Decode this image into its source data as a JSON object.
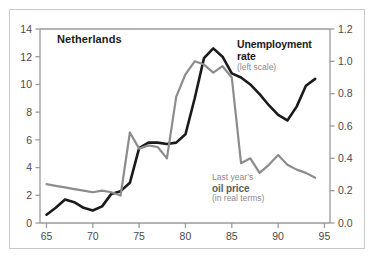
{
  "labels": {
    "country": "Netherlands",
    "unemployment_title": "Unemployment",
    "unemployment_title_line2": "rate",
    "unemployment_sub": "(left scale)",
    "oil_line1": "Last year’s",
    "oil_line2": "oil price",
    "oil_sub": "(in real terms)"
  },
  "colors": {
    "unemployment_line": "#1a1a1a",
    "oil_line": "#8c8c8c",
    "axis": "#9a9a9a",
    "tick_label": "#4a4a4a",
    "frame_border": "#c9c9c9",
    "background": "#ffffff",
    "annotation_gray": "#8a8a8a"
  },
  "axes": {
    "x_ticks": [
      "65",
      "70",
      "75",
      "80",
      "85",
      "90",
      "95"
    ],
    "x_tick_values": [
      65,
      70,
      75,
      80,
      85,
      90,
      95
    ],
    "y_left_ticks": [
      "0",
      "2",
      "4",
      "6",
      "8",
      "10",
      "12",
      "14"
    ],
    "y_left_values": [
      0,
      2,
      4,
      6,
      8,
      10,
      12,
      14
    ],
    "y_right_ticks": [
      "0.0",
      "0.2",
      "0.4",
      "0.6",
      "0.8",
      "1.0",
      "1.2"
    ],
    "y_right_values": [
      0.0,
      0.2,
      0.4,
      0.6,
      0.8,
      1.0,
      1.2
    ]
  },
  "chart_data": {
    "type": "line",
    "title": "Netherlands",
    "xlabel": "",
    "ylabel": "",
    "xlim": [
      64.3,
      95.6
    ],
    "ylim": [
      0,
      14
    ],
    "y2lim": [
      0,
      1.2
    ],
    "grid": false,
    "legend_position": "inline-annotations",
    "x": [
      65,
      66,
      67,
      68,
      69,
      70,
      71,
      72,
      73,
      74,
      75,
      76,
      77,
      78,
      79,
      80,
      81,
      82,
      83,
      84,
      85,
      86,
      87,
      88,
      89,
      90,
      91,
      92,
      93,
      94
    ],
    "series": [
      {
        "name": "Unemployment rate",
        "axis": "left",
        "units": "percent",
        "color": "#1a1a1a",
        "annotation": "Unemployment rate (left scale)",
        "values": [
          0.6,
          1.1,
          1.7,
          1.5,
          1.1,
          0.9,
          1.2,
          2.1,
          2.3,
          2.9,
          5.4,
          5.8,
          5.8,
          5.7,
          5.8,
          6.4,
          9.0,
          11.9,
          12.6,
          12.0,
          10.8,
          10.5,
          10.0,
          9.3,
          8.5,
          7.8,
          7.4,
          8.4,
          9.9,
          10.4
        ]
      },
      {
        "name": "Last year's oil price (in real terms)",
        "axis": "right",
        "units": "index",
        "color": "#8c8c8c",
        "annotation": "Last year’s oil price (in real terms)",
        "values": [
          0.24,
          0.23,
          0.22,
          0.21,
          0.2,
          0.19,
          0.2,
          0.19,
          0.17,
          0.56,
          0.46,
          0.48,
          0.47,
          0.4,
          0.78,
          0.92,
          1.0,
          0.98,
          0.93,
          0.97,
          0.9,
          0.37,
          0.4,
          0.31,
          0.36,
          0.42,
          0.36,
          0.33,
          0.31,
          0.28
        ]
      }
    ]
  }
}
